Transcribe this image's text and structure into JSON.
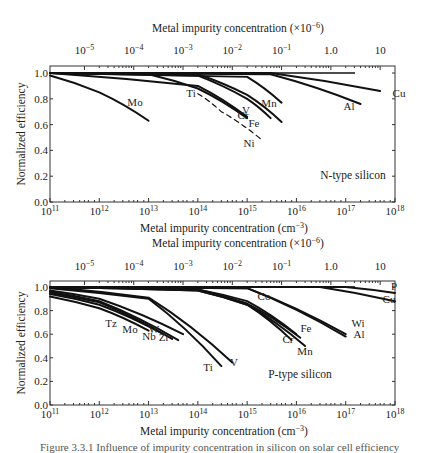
{
  "chart_data": [
    {
      "type": "line",
      "title": "N-type silicon",
      "xlabel": "Metal impurity concentration (cm⁻³)",
      "x2label": "Metal impurity concentration (×10⁻⁶)",
      "ylabel": "Normalized efficiency",
      "xscale": "log",
      "xlim": [
        100000000000.0,
        1e+18
      ],
      "ylim": [
        0.0,
        1.05
      ],
      "x_ticks": [
        "10^11",
        "10^12",
        "10^13",
        "10^14",
        "10^15",
        "10^16",
        "10^17",
        "10^18"
      ],
      "x2_ticks": [
        "10^-5",
        "10^-4",
        "10^-3",
        "10^-2",
        "10^-1",
        "1.0",
        "10"
      ],
      "y_ticks": [
        "0.0",
        "0.2",
        "0.4",
        "0.6",
        "0.8",
        "1.0"
      ],
      "grid": false,
      "series": [
        {
          "name": "Mo",
          "x": [
            100000000000.0,
            1000000000000.0,
            10000000000000.0
          ],
          "y": [
            0.98,
            0.85,
            0.63
          ]
        },
        {
          "name": "Ti",
          "x": [
            100000000000.0,
            10000000000000.0,
            100000000000000.0,
            1000000000000000.0
          ],
          "y": [
            1.0,
            0.99,
            0.88,
            0.65
          ]
        },
        {
          "name": "V",
          "x": [
            100000000000.0,
            100000000000000.0,
            1000000000000000.0
          ],
          "y": [
            1.0,
            0.9,
            0.66
          ]
        },
        {
          "name": "Ni",
          "style": "dashed",
          "x": [
            100000000000000.0,
            300000000000000.0,
            2000000000000000.0
          ],
          "y": [
            0.84,
            0.7,
            0.48
          ]
        },
        {
          "name": "Cr",
          "x": [
            100000000000.0,
            100000000000000.0,
            1000000000000000.0,
            3000000000000000.0
          ],
          "y": [
            1.0,
            0.98,
            0.8,
            0.65
          ]
        },
        {
          "name": "Fe",
          "x": [
            100000000000.0,
            100000000000000.0,
            1000000000000000.0,
            5000000000000000.0
          ],
          "y": [
            1.0,
            0.99,
            0.83,
            0.62
          ]
        },
        {
          "name": "Mn",
          "x": [
            100000000000.0,
            1000000000000000.0,
            5000000000000000.0
          ],
          "y": [
            1.0,
            0.97,
            0.77
          ]
        },
        {
          "name": "Al",
          "x": [
            100000000000.0,
            3000000000000000.0,
            2e+17
          ],
          "y": [
            1.0,
            0.99,
            0.76
          ]
        },
        {
          "name": "Cu",
          "x": [
            100000000000.0,
            3000000000000000.0,
            5e+17
          ],
          "y": [
            1.0,
            1.0,
            0.86
          ]
        }
      ],
      "annotations": [
        "Mo",
        "Ti",
        "V",
        "Ni",
        "Cr",
        "Fe",
        "Mn",
        "Al",
        "Cu",
        "N-type silicon"
      ]
    },
    {
      "type": "line",
      "title": "P-type silicon",
      "xlabel": "Metal impurity concentration (cm⁻³)",
      "x2label": "Metal impurity concentration (×10⁻⁶)",
      "ylabel": "Normalized efficiency",
      "xscale": "log",
      "xlim": [
        100000000000.0,
        1e+18
      ],
      "ylim": [
        0.0,
        1.05
      ],
      "x_ticks": [
        "10^11",
        "10^12",
        "10^13",
        "10^14",
        "10^15",
        "10^16",
        "10^17",
        "10^18"
      ],
      "x2_ticks": [
        "10^-5",
        "10^-4",
        "10^-3",
        "10^-2",
        "10^-1",
        "1.0",
        "10"
      ],
      "y_ticks": [
        "0.0",
        "0.2",
        "0.4",
        "0.6",
        "0.8",
        "1.0"
      ],
      "grid": false,
      "series": [
        {
          "name": "Tz",
          "x": [
            100000000000.0,
            1000000000000.0,
            10000000000000.0
          ],
          "y": [
            0.92,
            0.82,
            0.63
          ]
        },
        {
          "name": "Mo",
          "x": [
            100000000000.0,
            1000000000000.0,
            20000000000000.0
          ],
          "y": [
            0.94,
            0.85,
            0.6
          ]
        },
        {
          "name": "Nb",
          "x": [
            100000000000.0,
            1000000000000.0,
            30000000000000.0
          ],
          "y": [
            0.95,
            0.87,
            0.56
          ]
        },
        {
          "name": "Zr",
          "x": [
            100000000000.0,
            1000000000000.0,
            40000000000000.0
          ],
          "y": [
            0.96,
            0.88,
            0.55
          ]
        },
        {
          "name": "W",
          "x": [
            100000000000.0,
            1000000000000.0,
            50000000000000.0
          ],
          "y": [
            0.97,
            0.9,
            0.6
          ]
        },
        {
          "name": "Ti",
          "x": [
            100000000000.0,
            10000000000000.0,
            300000000000000.0
          ],
          "y": [
            0.99,
            0.9,
            0.33
          ]
        },
        {
          "name": "V",
          "x": [
            100000000000.0,
            10000000000000.0,
            500000000000000.0
          ],
          "y": [
            1.0,
            0.91,
            0.36
          ]
        },
        {
          "name": "Co",
          "x": [
            100000000000.0,
            100000000000000.0,
            1000000000000000.0,
            1e+16
          ],
          "y": [
            1.0,
            0.98,
            0.88,
            0.6
          ]
        },
        {
          "name": "Cr",
          "x": [
            100000000000.0,
            100000000000000.0,
            1000000000000000.0,
            8000000000000000.0
          ],
          "y": [
            1.0,
            0.97,
            0.85,
            0.55
          ]
        },
        {
          "name": "Fe",
          "x": [
            100000000000.0,
            100000000000000.0,
            1000000000000000.0,
            1.2e+16
          ],
          "y": [
            1.0,
            0.98,
            0.86,
            0.57
          ]
        },
        {
          "name": "Mn",
          "x": [
            100000000000.0,
            100000000000000.0,
            1000000000000000.0,
            1.5e+16
          ],
          "y": [
            1.0,
            0.97,
            0.85,
            0.5
          ]
        },
        {
          "name": "Wi",
          "x": [
            100000000000.0,
            1000000000000000.0,
            1e+17
          ],
          "y": [
            1.0,
            0.99,
            0.6
          ]
        },
        {
          "name": "Al",
          "x": [
            100000000000.0,
            1000000000000000.0,
            1e+17
          ],
          "y": [
            1.0,
            0.99,
            0.58
          ]
        },
        {
          "name": "P",
          "x": [
            100000000000.0,
            1e+17,
            1e+18
          ],
          "y": [
            1.0,
            1.0,
            0.95
          ]
        },
        {
          "name": "Cu",
          "x": [
            100000000000.0,
            3e+16,
            1e+18
          ],
          "y": [
            1.0,
            1.0,
            0.88
          ]
        }
      ],
      "annotations": [
        "Tz",
        "Mo",
        "Nb",
        "W",
        "Zr",
        "Ti",
        "V",
        "Co",
        "Fe",
        "Cr",
        "Mn",
        "Wi",
        "Al",
        "P",
        "Cu",
        "P-type silicon"
      ]
    }
  ],
  "figure": {
    "top_cut_text": "of metal impurities (source: cited text)",
    "caption": "Figure 3.3.1  Influence of impurity concentration in silicon on solar cell efficiency"
  },
  "labels": {
    "x2label": "Metal impurity concentration (×10⁻⁶)",
    "xlabel_base": "Metal impurity concentration (cm",
    "xlabel_exp": "−3",
    "xlabel_end": ")",
    "x2label_base": "Metal impurity concentration (×10",
    "x2label_exp": "−6",
    "ylabel": "Normalized efficiency",
    "n_type": "N-type silicon",
    "p_type": "P-type silicon"
  }
}
